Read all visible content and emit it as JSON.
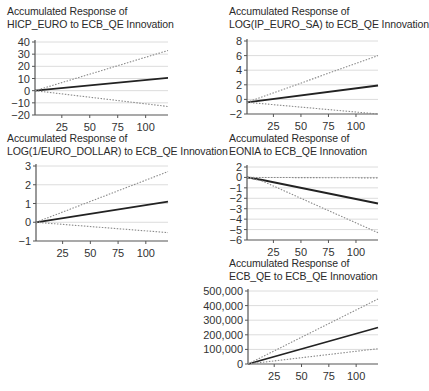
{
  "figure": {
    "background": "#ffffff",
    "line_colors": {
      "estimate": "#222222",
      "bands": "#8a8a8a",
      "grid": "#dcdcdc",
      "axis": "#555555"
    }
  },
  "chart_data": [
    {
      "id": "hicp",
      "type": "line",
      "title_line1": "Accumulated Response of",
      "title_line2": "HICP_EURO to ECB_QE Innovation",
      "xlabel": "",
      "ylabel": "",
      "xlim": [
        1,
        120
      ],
      "ylim": [
        -20,
        40
      ],
      "xticks": [
        25,
        50,
        75,
        100
      ],
      "yticks": [
        40,
        30,
        20,
        10,
        0,
        -10,
        -20
      ],
      "ytick_labels": [
        "40",
        "30",
        "20",
        "10",
        "0",
        "−10",
        "−20"
      ],
      "grid": true,
      "series": [
        {
          "name": "response",
          "style": "solid",
          "x": [
            1,
            120
          ],
          "values": [
            0,
            10.5
          ]
        },
        {
          "name": "upper band (+2 S.E.)",
          "style": "dotted",
          "x": [
            1,
            120
          ],
          "values": [
            0,
            33
          ]
        },
        {
          "name": "lower band (-2 S.E.)",
          "style": "dotted",
          "x": [
            1,
            120
          ],
          "values": [
            0,
            -13
          ]
        }
      ]
    },
    {
      "id": "ip",
      "type": "line",
      "title_line1": "Accumulated Response of",
      "title_line2": "LOG(IP_EURO_SA) to ECB_QE Innovation",
      "xlabel": "",
      "ylabel": "",
      "xlim": [
        1,
        120
      ],
      "ylim": [
        -2,
        8
      ],
      "xticks": [
        25,
        50,
        75,
        100
      ],
      "yticks": [
        8,
        6,
        4,
        2,
        0,
        -2
      ],
      "ytick_labels": [
        "8",
        "6",
        "4",
        "2",
        "0",
        "−2"
      ],
      "grid": true,
      "series": [
        {
          "name": "response",
          "style": "solid",
          "x": [
            1,
            120
          ],
          "values": [
            -0.4,
            1.9
          ]
        },
        {
          "name": "upper band (+2 S.E.)",
          "style": "dotted",
          "x": [
            1,
            120
          ],
          "values": [
            -0.4,
            6.0
          ]
        },
        {
          "name": "lower band (-2 S.E.)",
          "style": "dotted",
          "x": [
            1,
            120
          ],
          "values": [
            -0.4,
            -2.0
          ]
        }
      ]
    },
    {
      "id": "dollar",
      "type": "line",
      "title_line1": "Accumulated Response of",
      "title_line2": "LOG(1/EURO_DOLLAR) to ECB_QE Innovation",
      "xlabel": "",
      "ylabel": "",
      "xlim": [
        1,
        120
      ],
      "ylim": [
        -1,
        3
      ],
      "xticks": [
        25,
        50,
        75,
        100
      ],
      "yticks": [
        3,
        2,
        1,
        0,
        -1
      ],
      "ytick_labels": [
        "3",
        "2",
        "1",
        "0",
        "−1"
      ],
      "grid": true,
      "series": [
        {
          "name": "response",
          "style": "solid",
          "x": [
            1,
            120
          ],
          "values": [
            0,
            1.1
          ]
        },
        {
          "name": "upper band (+2 S.E.)",
          "style": "dotted",
          "x": [
            1,
            120
          ],
          "values": [
            0,
            2.7
          ]
        },
        {
          "name": "lower band (-2 S.E.)",
          "style": "dotted",
          "x": [
            1,
            120
          ],
          "values": [
            0,
            -0.55
          ]
        }
      ]
    },
    {
      "id": "eonia",
      "type": "line",
      "title_line1": "Accumulated Response of",
      "title_line2": "EONIA to ECB_QE Innovation",
      "xlabel": "",
      "ylabel": "",
      "xlim": [
        1,
        120
      ],
      "ylim": [
        -6,
        1
      ],
      "xticks": [
        25,
        50,
        75,
        100
      ],
      "yticks": [
        1,
        0,
        -1,
        -2,
        -3,
        -4,
        -5,
        -6
      ],
      "ytick_labels": [
        "2",
        "0",
        "−1",
        "−2",
        "−3",
        "−4",
        "−5",
        "−6"
      ],
      "grid": true,
      "series": [
        {
          "name": "response",
          "style": "solid",
          "x": [
            1,
            15,
            120
          ],
          "values": [
            0,
            -0.25,
            -2.5
          ]
        },
        {
          "name": "upper band (+2 S.E.)",
          "style": "dotted",
          "x": [
            1,
            120
          ],
          "values": [
            0,
            -0.05
          ]
        },
        {
          "name": "lower band (-2 S.E.)",
          "style": "dotted",
          "x": [
            1,
            15,
            120
          ],
          "values": [
            0,
            -0.35,
            -5.3
          ]
        }
      ]
    },
    {
      "id": "ecbqe",
      "type": "line",
      "title_line1": "Accumulated Response of",
      "title_line2": "ECB_QE to ECB_QE Innovation",
      "xlabel": "",
      "ylabel": "",
      "xlim": [
        1,
        120
      ],
      "ylim": [
        0,
        500000
      ],
      "xticks": [
        25,
        50,
        75,
        100
      ],
      "yticks": [
        500000,
        400000,
        300000,
        200000,
        100000,
        0
      ],
      "ytick_labels": [
        "500,000",
        "400,000",
        "300,000",
        "200,000",
        "100,000",
        "0"
      ],
      "grid": true,
      "series": [
        {
          "name": "response",
          "style": "solid",
          "x": [
            1,
            120
          ],
          "values": [
            0,
            250000
          ]
        },
        {
          "name": "upper band (+2 S.E.)",
          "style": "dotted",
          "x": [
            1,
            120
          ],
          "values": [
            0,
            445000
          ]
        },
        {
          "name": "lower band (-2 S.E.)",
          "style": "dotted",
          "x": [
            1,
            120
          ],
          "values": [
            0,
            105000
          ]
        }
      ]
    }
  ],
  "layout": [
    {
      "chart": 0,
      "title_x": 7,
      "title_y": 5,
      "plot": {
        "x0": 35,
        "x1": 168,
        "y0": 42,
        "y1": 115
      }
    },
    {
      "chart": 1,
      "title_x": 229,
      "title_y": 5,
      "plot": {
        "x0": 247,
        "x1": 378,
        "y0": 41,
        "y1": 114
      }
    },
    {
      "chart": 2,
      "title_x": 7,
      "title_y": 132,
      "plot": {
        "x0": 36,
        "x1": 168,
        "y0": 166,
        "y1": 241
      }
    },
    {
      "chart": 3,
      "title_x": 229,
      "title_y": 132,
      "plot": {
        "x0": 247,
        "x1": 378,
        "y0": 167,
        "y1": 240
      }
    },
    {
      "chart": 4,
      "title_x": 229,
      "title_y": 257,
      "plot": {
        "x0": 248,
        "x1": 378,
        "y0": 291,
        "y1": 364
      }
    }
  ]
}
